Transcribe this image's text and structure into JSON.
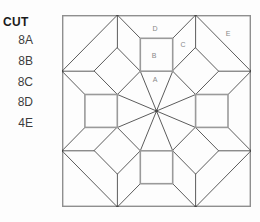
{
  "page": {
    "background_color": "#fdfdfd"
  },
  "cut_list": {
    "title": "CUT",
    "items": [
      "8A",
      "8B",
      "8C",
      "8D",
      "4E"
    ]
  },
  "diagram": {
    "piece_labels": [
      {
        "label": "D",
        "x": 93,
        "y": 13
      },
      {
        "label": "B",
        "x": 92,
        "y": 40
      },
      {
        "label": "C",
        "x": 121,
        "y": 29
      },
      {
        "label": "A",
        "x": 93,
        "y": 64
      },
      {
        "label": "E",
        "x": 166,
        "y": 18
      }
    ],
    "colors": {
      "line": "#5c5c5c",
      "square_outline": "#9a9a9a",
      "border": "#8f8f8f",
      "label": "#888888",
      "dot": "#474747",
      "text": "#3d3d3d",
      "title": "#1b1b1b"
    }
  }
}
